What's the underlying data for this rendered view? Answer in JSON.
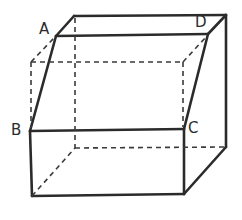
{
  "figure": {
    "type": "cube-with-oblique-section",
    "labels": {
      "A": "A",
      "B": "B",
      "C": "C",
      "D": "D"
    },
    "colors": {
      "line": "#2b2b2b",
      "background": "#ffffff"
    }
  }
}
